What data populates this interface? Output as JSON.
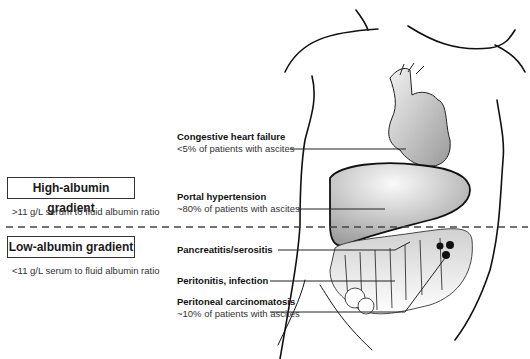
{
  "gradients": {
    "high": {
      "title": "High-albumin gradient",
      "note": ">11 g/L serum to fluid albumin ratio"
    },
    "low": {
      "title": "Low-albumin gradient",
      "note": "<11 g/L serum to fluid albumin ratio"
    }
  },
  "labels": [
    {
      "title": "Congestive heart failure",
      "subtitle": "<5% of patients with ascites",
      "organ": "heart"
    },
    {
      "title": "Portal hypertension",
      "subtitle": "~80% of patients with ascites",
      "organ": "liver"
    },
    {
      "title": "Pancreatitis/serositis",
      "subtitle": "",
      "organ": "pancreas"
    },
    {
      "title": "Peritonitis, infection",
      "subtitle": "",
      "organ": "peritoneum"
    },
    {
      "title": "Peritoneal carcinomatosis",
      "subtitle": "~10% of patients with ascites",
      "organ": "peritoneal-nodules"
    }
  ],
  "colors": {
    "line": "#222222",
    "dash": "#444444",
    "organ_fill": "#cfcfcf"
  }
}
